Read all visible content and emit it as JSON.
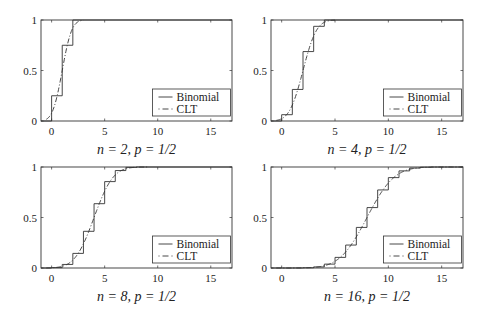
{
  "figure": {
    "width": 488,
    "height": 318,
    "line_color": "#333333",
    "background": "#ffffff"
  },
  "chart_data": [
    {
      "type": "line",
      "title": "n = 2, p = 1/2",
      "n": 2,
      "p": 0.5,
      "xlabel": "",
      "ylabel": "",
      "xlim": [
        -1,
        17
      ],
      "ylim": [
        0,
        1
      ],
      "xticks": [
        0,
        5,
        10,
        15
      ],
      "xtick_labels": [
        "0",
        "5",
        "10",
        "15"
      ],
      "yticks": [
        0,
        0.5,
        1
      ],
      "ytick_labels": [
        "0",
        "0.5",
        "1"
      ],
      "grid": false,
      "legend": {
        "position": "lower right",
        "entries": [
          "Binomial",
          "CLT"
        ]
      },
      "series": [
        {
          "name": "Binomial",
          "style": "solid step",
          "x": [
            0,
            1,
            2
          ],
          "values": [
            0.25,
            0.75,
            1.0
          ]
        },
        {
          "name": "CLT",
          "style": "dash-dot",
          "description": "Normal CDF with mean np, variance np(1-p), continuity-corrected"
        }
      ]
    },
    {
      "type": "line",
      "title": "n = 4, p = 1/2",
      "n": 4,
      "p": 0.5,
      "xlabel": "",
      "ylabel": "",
      "xlim": [
        -1,
        17
      ],
      "ylim": [
        0,
        1
      ],
      "xticks": [
        0,
        5,
        10,
        15
      ],
      "xtick_labels": [
        "0",
        "5",
        "10",
        "15"
      ],
      "yticks": [
        0,
        0.5,
        1
      ],
      "ytick_labels": [
        "0",
        "0.5",
        "1"
      ],
      "grid": false,
      "legend": {
        "position": "lower right",
        "entries": [
          "Binomial",
          "CLT"
        ]
      },
      "series": [
        {
          "name": "Binomial",
          "style": "solid step",
          "x": [
            0,
            1,
            2,
            3,
            4
          ],
          "values": [
            0.0625,
            0.3125,
            0.6875,
            0.9375,
            1.0
          ]
        },
        {
          "name": "CLT",
          "style": "dash-dot"
        }
      ]
    },
    {
      "type": "line",
      "title": "n = 8, p = 1/2",
      "n": 8,
      "p": 0.5,
      "xlabel": "",
      "ylabel": "",
      "xlim": [
        -1,
        17
      ],
      "ylim": [
        0,
        1
      ],
      "xticks": [
        0,
        5,
        10,
        15
      ],
      "xtick_labels": [
        "0",
        "5",
        "10",
        "15"
      ],
      "yticks": [
        0,
        0.5,
        1
      ],
      "ytick_labels": [
        "0",
        "0.5",
        "1"
      ],
      "grid": false,
      "legend": {
        "position": "lower right",
        "entries": [
          "Binomial",
          "CLT"
        ]
      },
      "series": [
        {
          "name": "Binomial",
          "style": "solid step",
          "x": [
            0,
            1,
            2,
            3,
            4,
            5,
            6,
            7,
            8
          ],
          "values": [
            0.0039,
            0.0352,
            0.1445,
            0.3633,
            0.6367,
            0.8555,
            0.9648,
            0.9961,
            1.0
          ]
        },
        {
          "name": "CLT",
          "style": "dash-dot"
        }
      ]
    },
    {
      "type": "line",
      "title": "n = 16, p = 1/2",
      "n": 16,
      "p": 0.5,
      "xlabel": "",
      "ylabel": "",
      "xlim": [
        -1,
        17
      ],
      "ylim": [
        0,
        1
      ],
      "xticks": [
        0,
        5,
        10,
        15
      ],
      "xtick_labels": [
        "0",
        "5",
        "10",
        "15"
      ],
      "yticks": [
        0,
        0.5,
        1
      ],
      "ytick_labels": [
        "0",
        "0.5",
        "1"
      ],
      "grid": false,
      "legend": {
        "position": "lower right",
        "entries": [
          "Binomial",
          "CLT"
        ]
      },
      "series": [
        {
          "name": "Binomial",
          "style": "solid step",
          "x": [
            0,
            1,
            2,
            3,
            4,
            5,
            6,
            7,
            8,
            9,
            10,
            11,
            12,
            13,
            14,
            15,
            16
          ],
          "values": [
            0.0,
            0.0003,
            0.0021,
            0.0106,
            0.0384,
            0.1051,
            0.2272,
            0.4018,
            0.5982,
            0.7728,
            0.8949,
            0.9616,
            0.9894,
            0.9979,
            0.9997,
            1.0,
            1.0
          ]
        },
        {
          "name": "CLT",
          "style": "dash-dot"
        }
      ]
    }
  ],
  "panels": [
    {
      "box": {
        "x": 41,
        "y": 20,
        "w": 191,
        "h": 101
      }
    },
    {
      "box": {
        "x": 271,
        "y": 20,
        "w": 192,
        "h": 101
      }
    },
    {
      "box": {
        "x": 41,
        "y": 167,
        "w": 191,
        "h": 101
      }
    },
    {
      "box": {
        "x": 271,
        "y": 167,
        "w": 192,
        "h": 101
      }
    }
  ]
}
